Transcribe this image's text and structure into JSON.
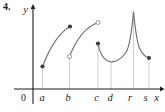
{
  "problem_number": "4.",
  "colors": {
    "background": "#ffffff",
    "axis": "#1c1c1c",
    "curve": "#6f6f6f",
    "guide_line": "#c3c3c3",
    "closed_dot": "#3d3d3d",
    "open_dot_stroke": "#8a8a8a",
    "text": "#1c1c1c"
  },
  "chart_data": {
    "type": "line",
    "xlabel": "x",
    "ylabel": "y",
    "origin_label": "0",
    "x_ticks": [
      "a",
      "b",
      "c",
      "d",
      "r",
      "s"
    ],
    "ylim_rel": [
      0,
      10
    ],
    "grid": "off",
    "legend": "none",
    "guide_style": "thin light vertical line from x-axis up to the curve at each labeled x value",
    "segments": [
      {
        "interval": "[a, b]",
        "shape": "increasing, concave down arc",
        "left_endpoint": {
          "x": "a",
          "type": "closed",
          "rel_value": 2.5
        },
        "right_endpoint": {
          "x": "b",
          "type": "closed",
          "rel_value": 6.9
        }
      },
      {
        "interval": "(b, c)",
        "shape": "increasing, concave down arc",
        "left_endpoint": {
          "x": "b",
          "type": "open",
          "rel_value": 3.6
        },
        "right_endpoint": {
          "x": "c",
          "type": "open",
          "rel_value": 7.4
        }
      },
      {
        "interval": "[c, s]",
        "shape": "falls to a local minimum near d, rises steeply to a sharp cusp peak at r, then falls and levels off toward s",
        "left_endpoint": {
          "x": "c",
          "type": "closed",
          "rel_value": 5.1
        },
        "local_min": {
          "x": "d",
          "rel_value": 3.0
        },
        "peak": {
          "x": "r",
          "rel_value": 8.6
        },
        "right_endpoint": {
          "x": "s",
          "type": "closed",
          "rel_value": 3.4
        }
      }
    ],
    "svg": {
      "width": 165,
      "height": 112,
      "x_axis": {
        "x1": 14,
        "y1": 89,
        "x2": 160,
        "y2": 89,
        "arrow": "160,86.6 164.5,89 160,91.4"
      },
      "y_axis": {
        "x1": 33,
        "y1": 104,
        "x2": 33,
        "y2": 8,
        "arrow": "30.6,9 33,4 35.4,9"
      },
      "paths": {
        "curve1": "M42.5,66.5 C47.5,53.5 56.5,34.5 70,26.5",
        "curve2": "M69.5,56.5 C75,42.5 84,27.5 98,22.5",
        "curve3": "M98,43.5 C99,51 103,60.5 110.5,61.8 C116.5,62.6 121.5,58.5 126,52.5 C129,47.5 132,29 133.5,11.5 C134.8,25 136.3,38.5 139,47 C142,54 145.5,57.2 149,58"
      },
      "guides": [
        {
          "x": 42.5,
          "y1": 66.5,
          "y2": 89
        },
        {
          "x": 69.5,
          "y1": 56.5,
          "y2": 89
        },
        {
          "x": 98,
          "y1": 43.5,
          "y2": 89
        },
        {
          "x": 111,
          "y1": 62,
          "y2": 89
        },
        {
          "x": 133.5,
          "y1": 11.5,
          "y2": 89
        },
        {
          "x": 149,
          "y1": 58,
          "y2": 89
        }
      ],
      "closed_dots": [
        {
          "cx": 42.5,
          "cy": 66.5
        },
        {
          "cx": 70,
          "cy": 26.5
        },
        {
          "cx": 98,
          "cy": 43.5
        },
        {
          "cx": 149,
          "cy": 58
        }
      ],
      "open_dots": [
        {
          "cx": 69.5,
          "cy": 56.5
        },
        {
          "cx": 98,
          "cy": 22.5
        }
      ],
      "tick_label_pos": [
        {
          "x": 42,
          "y": 101
        },
        {
          "x": 68,
          "y": 101
        },
        {
          "x": 96.5,
          "y": 101
        },
        {
          "x": 110,
          "y": 101
        },
        {
          "x": 130,
          "y": 101
        },
        {
          "x": 145.5,
          "y": 101
        }
      ],
      "origin_pos": {
        "x": 23.5,
        "y": 101
      },
      "x_label_pos": {
        "x": 156.5,
        "y": 101
      },
      "y_label_pos": {
        "x": 25.5,
        "y": 13
      },
      "problem_pos": {
        "x": 3,
        "y": 10
      }
    }
  }
}
